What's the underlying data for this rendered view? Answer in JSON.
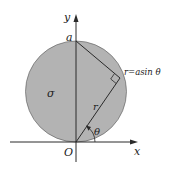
{
  "diagram": {
    "title": "",
    "region_label": "σ",
    "axes": {
      "x_label": "x",
      "y_label": "y",
      "origin_label": "O"
    },
    "points": {
      "top": "a"
    },
    "labels": {
      "radius": "r",
      "angle": "θ",
      "curve_equation": "r=asin θ"
    },
    "colors": {
      "disk_fill": "#b3b3b3",
      "stroke": "#2a2a2a",
      "background": "#ffffff"
    }
  }
}
